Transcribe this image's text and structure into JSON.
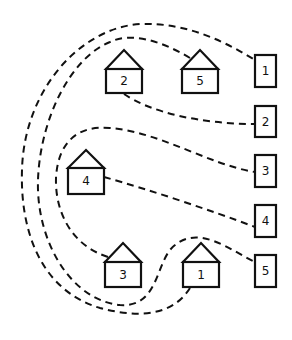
{
  "diagram": {
    "type": "matching-puzzle",
    "colors": {
      "stroke": "#111111",
      "background": "#ffffff"
    },
    "houses": [
      {
        "label": "2",
        "x": 106,
        "y": 50
      },
      {
        "label": "5",
        "x": 182,
        "y": 50
      },
      {
        "label": "4",
        "x": 68,
        "y": 150
      },
      {
        "label": "3",
        "x": 105,
        "y": 243
      },
      {
        "label": "1",
        "x": 183,
        "y": 243
      }
    ],
    "boxes": [
      {
        "label": "1",
        "x": 255,
        "y": 55
      },
      {
        "label": "2",
        "x": 255,
        "y": 106
      },
      {
        "label": "3",
        "x": 255,
        "y": 155
      },
      {
        "label": "4",
        "x": 255,
        "y": 205
      },
      {
        "label": "5",
        "x": 255,
        "y": 255
      }
    ],
    "connections": [
      {
        "from_house": "1",
        "to_box": "1"
      },
      {
        "from_house": "2",
        "to_box": "2"
      },
      {
        "from_house": "3",
        "to_box": "3"
      },
      {
        "from_house": "4",
        "to_box": "4"
      },
      {
        "from_house": "5",
        "to_box": "5"
      }
    ]
  }
}
